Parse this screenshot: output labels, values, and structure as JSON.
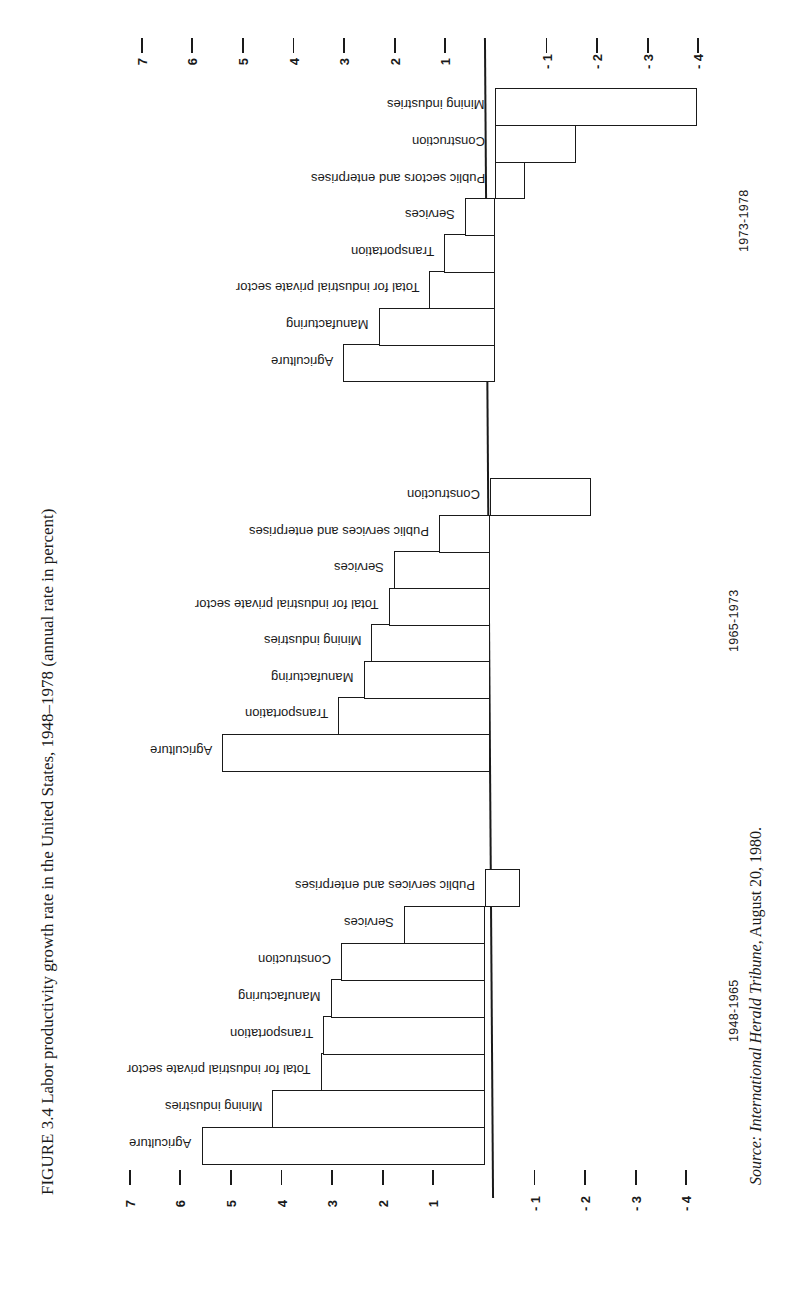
{
  "figure": {
    "title": "FIGURE 3.4 Labor productivity growth rate in the United States, 1948–1978 (annual rate in percent)",
    "source_prefix": "Source: ",
    "source_publication": "International Herald Tribune",
    "source_suffix": ", August 20, 1980."
  },
  "axis": {
    "ticks": [
      7,
      6,
      5,
      4,
      3,
      2,
      1,
      -1,
      -2,
      -3,
      -4
    ],
    "tick_labels": [
      "7",
      "6",
      "5",
      "4",
      "3",
      "2",
      "1",
      "- 1",
      "- 2",
      "- 3",
      "- 4"
    ]
  },
  "periods": [
    {
      "label": "1948-1965"
    },
    {
      "label": "1965-1973"
    },
    {
      "label": "1973-1978"
    }
  ],
  "colors": {
    "ink": "#1a1a1a",
    "background": "#ffffff"
  },
  "chart_data": {
    "type": "bar",
    "orientation": "horizontal (page rotated 90°)",
    "title": "Labor productivity growth rate in the United States, 1948–1978 (annual rate in percent)",
    "xlabel": "",
    "ylabel": "Annual rate in percent",
    "ylim": [
      -4,
      7
    ],
    "grid": false,
    "legend": "none; period labels under each group",
    "groups": [
      {
        "period": "1948-1965",
        "categories": [
          "Agriculture",
          "Mining industries",
          "Total for industrial private sector",
          "Transportation",
          "Manufacturing",
          "Construction",
          "Services",
          "Public services and enterprises"
        ],
        "values": [
          5.6,
          4.2,
          3.25,
          3.2,
          3.05,
          2.85,
          1.6,
          -0.7
        ]
      },
      {
        "period": "1965-1973",
        "categories": [
          "Agriculture",
          "Transportation",
          "Manufacturing",
          "Mining industries",
          "Total for industrial private sector",
          "Services",
          "Public services and enterprises",
          "Construction"
        ],
        "values": [
          5.3,
          3.0,
          2.5,
          2.35,
          2.0,
          1.9,
          1.0,
          -2.0
        ]
      },
      {
        "period": "1973-1978",
        "categories": [
          "Agriculture",
          "Manufacturing",
          "Total for industrial private sector",
          "Transportation",
          "Services",
          "Public sectors and enterprises",
          "Construction",
          "Mining industries"
        ],
        "values": [
          3.0,
          2.3,
          1.3,
          1.0,
          0.6,
          -0.6,
          -1.6,
          -4.0
        ]
      }
    ]
  }
}
